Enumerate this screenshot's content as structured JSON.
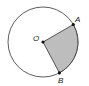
{
  "diagram": {
    "type": "circle-sector",
    "labels": {
      "center": "O",
      "point_a": "A",
      "point_b": "B"
    },
    "colors": {
      "outline": "#333333",
      "sector_fill": "#bdbdbd",
      "point": "#111111"
    }
  }
}
